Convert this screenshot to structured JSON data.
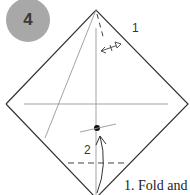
{
  "step": {
    "number": "4",
    "badge_color": "#a8a8a8"
  },
  "diagram": {
    "shape": "square rotated 45° (diamond)",
    "labels": {
      "fold_1": "1",
      "fold_2": "2"
    },
    "lines": {
      "outline_color": "#333333",
      "crease_color": "#888888"
    }
  },
  "caption": {
    "text": "1. Fold and"
  }
}
